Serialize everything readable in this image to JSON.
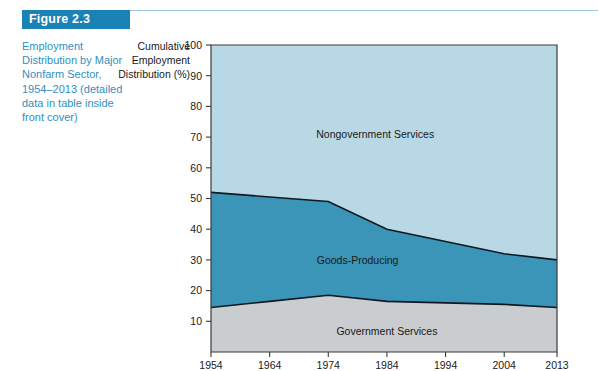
{
  "figure": {
    "banner_label": "Figure 2.3",
    "caption": "Employment Distribution by Major Nonfarm Sector, 1954–2013 (detailed data in table inside front cover)",
    "banner_color": "#1b82b5",
    "caption_color": "#2f8fc0"
  },
  "chart_data": {
    "type": "area",
    "stacked": true,
    "title": "Employment Distribution by Major Nonfarm Sector, 1954–2013",
    "xlabel": "",
    "ylabel": "Cumulative Employment Distribution (%)",
    "x": [
      1954,
      1964,
      1974,
      1984,
      1994,
      2004,
      2013
    ],
    "xtick_labels": [
      "1954",
      "1964",
      "1974",
      "1984",
      "1994",
      "2004",
      "2013"
    ],
    "xlim": [
      1954,
      2013
    ],
    "ylim": [
      0,
      100
    ],
    "ytick_labels": [
      "10",
      "20",
      "30",
      "40",
      "50",
      "60",
      "70",
      "80",
      "90",
      "100"
    ],
    "yticks": [
      10,
      20,
      30,
      40,
      50,
      60,
      70,
      80,
      90,
      100
    ],
    "grid": false,
    "legend_position": "inline-labels",
    "series": [
      {
        "name": "Government Services",
        "values": [
          14.5,
          16.5,
          18.5,
          16.5,
          16.0,
          15.5,
          14.5
        ],
        "color": "#c9cdcf",
        "label_x": 1984,
        "label_y": 7
      },
      {
        "name": "Goods-Producing",
        "values": [
          37.5,
          34.0,
          30.5,
          23.5,
          20.0,
          16.5,
          15.5
        ],
        "color": "#3a95b8",
        "label_x": 1979,
        "label_y": 30
      },
      {
        "name": "Nongovernment Services",
        "values": [
          48.0,
          49.5,
          51.0,
          60.0,
          64.0,
          68.0,
          70.0
        ],
        "color": "#b8d8e6",
        "label_x": 1982,
        "label_y": 71
      }
    ],
    "cumulative_boundaries": {
      "government_services_top": [
        14.5,
        16.5,
        18.5,
        16.5,
        16.0,
        15.5,
        14.5
      ],
      "goods_producing_top": [
        52.0,
        50.5,
        49.0,
        40.0,
        36.0,
        32.0,
        30.0
      ],
      "nongovernment_services_top": [
        100,
        100,
        100,
        100,
        100,
        100,
        100
      ]
    }
  }
}
